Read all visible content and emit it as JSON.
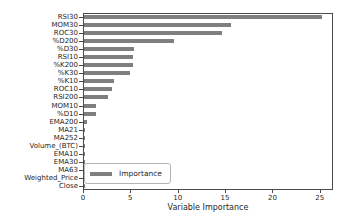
{
  "figure": {
    "xlabel": "Variable Importance",
    "legend": {
      "label": "Importance",
      "swatch_color": "#7f7f7f"
    },
    "colors": {
      "bar": "#7f7f7f",
      "axis": "#4a4a4a",
      "text": "#262626",
      "legend_border": "#b5b5b5",
      "background": "#ffffff"
    }
  },
  "chart_data": {
    "type": "bar",
    "orientation": "horizontal",
    "title": "",
    "xlabel": "Variable Importance",
    "ylabel": "",
    "categories": [
      "RSI30",
      "MOM30",
      "ROC30",
      "%D200",
      "%D30",
      "RSI10",
      "%K200",
      "%K30",
      "%K10",
      "ROC10",
      "RSI200",
      "MOM10",
      "%D10",
      "EMA200",
      "MA21",
      "MA252",
      "Volume_(BTC)",
      "EMA10",
      "EMA30",
      "MA63",
      "Weighted_Price",
      "Close"
    ],
    "values": [
      25.1,
      15.5,
      14.6,
      9.5,
      5.3,
      5.2,
      5.2,
      4.9,
      3.2,
      3.0,
      2.5,
      1.3,
      1.3,
      0.3,
      0.15,
      0.15,
      0.15,
      0.15,
      0.15,
      0.15,
      0.15,
      0.1
    ],
    "series": [
      {
        "name": "Importance",
        "values": [
          25.1,
          15.5,
          14.6,
          9.5,
          5.3,
          5.2,
          5.2,
          4.9,
          3.2,
          3.0,
          2.5,
          1.3,
          1.3,
          0.3,
          0.15,
          0.15,
          0.15,
          0.15,
          0.15,
          0.15,
          0.15,
          0.1
        ]
      }
    ],
    "xlim": [
      0,
      26.4
    ],
    "xticks": [
      0,
      5,
      10,
      15,
      20,
      25
    ],
    "grid": false,
    "legend_position": "lower left",
    "bar_color": "#7f7f7f"
  }
}
